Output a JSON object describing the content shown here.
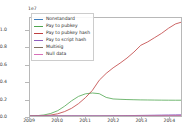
{
  "chart_data": {
    "type": "line",
    "title": "",
    "xlabel": "",
    "ylabel": "",
    "y_exponent_label": "1e7",
    "xlim": [
      2009.0,
      2014.45
    ],
    "ylim": [
      0.0,
      11500000
    ],
    "grid": false,
    "legend_position": "upper left",
    "x_ticks": [
      "2009",
      "2010",
      "2011",
      "2012",
      "2013",
      "2014"
    ],
    "x_tick_values": [
      2009,
      2010,
      2011,
      2012,
      2013,
      2014
    ],
    "y_ticks": [
      "0.0",
      "0.2",
      "0.4",
      "0.6",
      "0.8",
      "1.0"
    ],
    "y_tick_values": [
      0,
      2000000,
      4000000,
      6000000,
      8000000,
      10000000
    ],
    "x": [
      2009.0,
      2009.25,
      2009.5,
      2009.75,
      2010.0,
      2010.25,
      2010.5,
      2010.75,
      2011.0,
      2011.25,
      2011.5,
      2011.75,
      2012.0,
      2012.25,
      2012.5,
      2012.75,
      2013.0,
      2013.25,
      2013.5,
      2013.75,
      2014.0,
      2014.25,
      2014.45
    ],
    "series": [
      {
        "name": "Nonstandard",
        "color": "#3f7fbf",
        "values": [
          0,
          0,
          0,
          0,
          0,
          0,
          0,
          0,
          0,
          0,
          0,
          0,
          0,
          0,
          0,
          0,
          0,
          0,
          0,
          0,
          0,
          0,
          0
        ]
      },
      {
        "name": "Pay to pubkey",
        "color": "#4fa64f",
        "values": [
          10000,
          40000,
          120000,
          300000,
          620000,
          1150000,
          1780000,
          2300000,
          2600000,
          2700000,
          2620000,
          2180000,
          2000000,
          1960000,
          1930000,
          1910000,
          1890000,
          1880000,
          1870000,
          1860000,
          1855000,
          1850000,
          1850000
        ]
      },
      {
        "name": "Pay to pubkey hash",
        "color": "#bf3f3f",
        "values": [
          0,
          10000,
          40000,
          110000,
          260000,
          520000,
          900000,
          1450000,
          2150000,
          3000000,
          4200000,
          5000000,
          5650000,
          6200000,
          6800000,
          7500000,
          8300000,
          8700000,
          9200000,
          9700000,
          10300000,
          10800000,
          11000000
        ]
      },
      {
        "name": "Pay to script hash",
        "color": "#8f5fbf",
        "values": [
          0,
          0,
          0,
          0,
          0,
          0,
          0,
          0,
          0,
          0,
          0,
          5000,
          15000,
          25000,
          40000,
          55000,
          70000,
          85000,
          100000,
          115000,
          130000,
          145000,
          155000
        ]
      },
      {
        "name": "Multisig",
        "color": "#7f6f5f",
        "values": [
          0,
          0,
          0,
          0,
          0,
          0,
          0,
          0,
          0,
          0,
          0,
          2000,
          5000,
          8000,
          12000,
          16000,
          20000,
          24000,
          28000,
          32000,
          36000,
          40000,
          43000
        ]
      },
      {
        "name": "Null data",
        "color": "#d96fb8",
        "values": [
          0,
          0,
          0,
          0,
          0,
          0,
          0,
          0,
          0,
          0,
          0,
          0,
          0,
          2000,
          5000,
          9000,
          14000,
          19000,
          24000,
          29000,
          34000,
          39000,
          42000
        ]
      }
    ]
  }
}
